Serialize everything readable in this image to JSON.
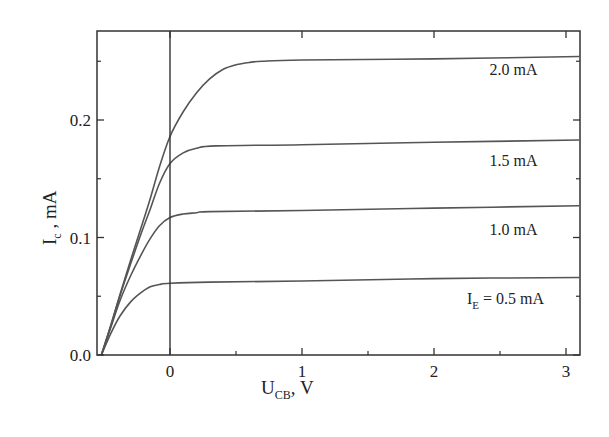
{
  "chart_data": {
    "type": "line",
    "title": "",
    "xlabel": "U_CB, V",
    "xlabel_main": "U",
    "xlabel_sub": "CB",
    "xlabel_unit": ", V",
    "ylabel": "I_c, mA",
    "ylabel_main": "I",
    "ylabel_sub": "c",
    "ylabel_unit": " , mA",
    "xlim": [
      -0.55,
      3.1
    ],
    "ylim": [
      0.0,
      0.275
    ],
    "grid": false,
    "legend": "inline labels at right",
    "x_ticks": [
      0,
      1,
      2,
      3
    ],
    "x_tick_labels": [
      "0",
      "1",
      "2",
      "3"
    ],
    "x_minor_ticks": [
      0.5,
      1.5,
      2.5
    ],
    "y_ticks": [
      0.0,
      0.1,
      0.2
    ],
    "y_tick_labels": [
      "0.0",
      "0.1",
      "0.2"
    ],
    "y_minor_ticks": [
      0.05,
      0.15,
      0.25
    ],
    "reference_line": {
      "x": 0,
      "style": "vertical"
    },
    "series": [
      {
        "name": "I_E = 0.5 mA",
        "label_main": "I",
        "label_sub": "E",
        "label_rest": " = 0.5 mA",
        "x": [
          -0.52,
          -0.45,
          -0.38,
          -0.3,
          -0.22,
          -0.15,
          -0.08,
          0.0,
          0.3,
          1.0,
          2.0,
          3.1
        ],
        "y": [
          0.0,
          0.018,
          0.033,
          0.045,
          0.053,
          0.058,
          0.06,
          0.061,
          0.062,
          0.063,
          0.065,
          0.066
        ]
      },
      {
        "name": "1.0 mA",
        "label_main": "1.0 mA",
        "x": [
          -0.52,
          -0.45,
          -0.38,
          -0.3,
          -0.22,
          -0.15,
          -0.08,
          0.0,
          0.1,
          0.2,
          0.3,
          1.0,
          2.0,
          3.1
        ],
        "y": [
          0.0,
          0.023,
          0.046,
          0.067,
          0.085,
          0.099,
          0.11,
          0.117,
          0.12,
          0.121,
          0.122,
          0.123,
          0.125,
          0.127
        ]
      },
      {
        "name": "1.5 mA",
        "label_main": "1.5 mA",
        "x": [
          -0.52,
          -0.45,
          -0.38,
          -0.3,
          -0.22,
          -0.15,
          -0.08,
          0.0,
          0.1,
          0.2,
          0.35,
          1.0,
          2.0,
          3.1
        ],
        "y": [
          0.0,
          0.024,
          0.05,
          0.077,
          0.103,
          0.124,
          0.146,
          0.163,
          0.172,
          0.176,
          0.178,
          0.179,
          0.181,
          0.183
        ]
      },
      {
        "name": "2.0 mA",
        "label_main": "2.0 mA",
        "x": [
          -0.52,
          -0.45,
          -0.38,
          -0.3,
          -0.22,
          -0.15,
          -0.08,
          0.0,
          0.1,
          0.2,
          0.3,
          0.4,
          0.5,
          0.6,
          0.7,
          1.0,
          2.0,
          3.1
        ],
        "y": [
          0.0,
          0.025,
          0.051,
          0.08,
          0.108,
          0.133,
          0.16,
          0.186,
          0.207,
          0.223,
          0.235,
          0.243,
          0.247,
          0.249,
          0.25,
          0.251,
          0.252,
          0.254
        ]
      }
    ],
    "annotations": [
      {
        "text": "2.0 mA",
        "x": 2.42,
        "y": 0.238
      },
      {
        "text": "1.5 mA",
        "x": 2.42,
        "y": 0.161
      },
      {
        "text": "1.0 mA",
        "x": 2.42,
        "y": 0.102
      },
      {
        "text": "I_E = 0.5 mA",
        "x": 2.25,
        "y": 0.043
      }
    ]
  },
  "colors": {
    "axis": "#333333",
    "curve": "#555555",
    "text": "#222222",
    "background": "#ffffff"
  }
}
